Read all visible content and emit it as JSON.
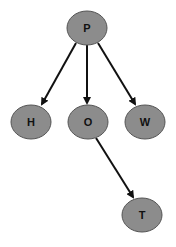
{
  "diagram": {
    "type": "directed-tree",
    "colors": {
      "node_fill": "#8c8c8c",
      "node_stroke": "#555555",
      "edge": "#111111",
      "background": "#ffffff"
    },
    "nodes": [
      {
        "id": "P",
        "label": "P",
        "cx": 87,
        "cy": 28
      },
      {
        "id": "H",
        "label": "H",
        "cx": 31,
        "cy": 122
      },
      {
        "id": "O",
        "label": "O",
        "cx": 88,
        "cy": 122
      },
      {
        "id": "W",
        "label": "W",
        "cx": 145,
        "cy": 122
      },
      {
        "id": "T",
        "label": "T",
        "cx": 142,
        "cy": 215
      }
    ],
    "edges": [
      {
        "from": "P",
        "to": "H"
      },
      {
        "from": "P",
        "to": "O"
      },
      {
        "from": "P",
        "to": "W"
      },
      {
        "from": "O",
        "to": "T"
      }
    ]
  }
}
